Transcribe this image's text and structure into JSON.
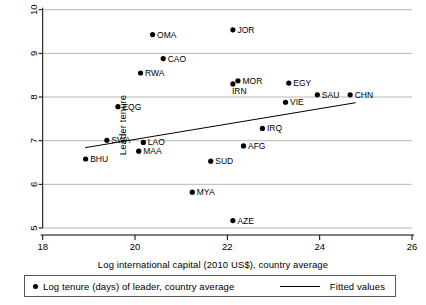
{
  "chart_data": {
    "type": "scatter",
    "title": "",
    "xlabel": "Log international capital (2010 US$), country average",
    "ylabel": "Leader tenure",
    "xlim": [
      18,
      26
    ],
    "ylim": [
      5,
      10
    ],
    "xticks": [
      18,
      20,
      22,
      24,
      26
    ],
    "yticks": [
      5,
      6,
      7,
      8,
      9,
      10
    ],
    "grid": "horizontal",
    "legend_position": "bottom",
    "series": [
      {
        "name": "Log tenure (days) of leader, country average",
        "marker": "filled-circle",
        "color": "#000000",
        "points": [
          {
            "label": "OMA",
            "x": 20.38,
            "y": 9.43
          },
          {
            "label": "CAO",
            "x": 20.61,
            "y": 8.88
          },
          {
            "label": "RWA",
            "x": 20.12,
            "y": 8.55
          },
          {
            "label": "EQG",
            "x": 19.63,
            "y": 7.78
          },
          {
            "label": "SWA",
            "x": 19.39,
            "y": 7.01
          },
          {
            "label": "BHU",
            "x": 18.93,
            "y": 6.58
          },
          {
            "label": "LAO",
            "x": 20.18,
            "y": 6.96
          },
          {
            "label": "MAA",
            "x": 20.08,
            "y": 6.76
          },
          {
            "label": "JOR",
            "x": 22.12,
            "y": 9.54
          },
          {
            "label": "MOR",
            "x": 22.23,
            "y": 8.37
          },
          {
            "label": "IRN",
            "x": 22.12,
            "y": 8.3
          },
          {
            "label": "EGY",
            "x": 23.33,
            "y": 8.32
          },
          {
            "label": "SAU",
            "x": 23.95,
            "y": 8.05
          },
          {
            "label": "CHN",
            "x": 24.66,
            "y": 8.05
          },
          {
            "label": "VIE",
            "x": 23.26,
            "y": 7.88
          },
          {
            "label": "IRQ",
            "x": 22.76,
            "y": 7.28
          },
          {
            "label": "AFG",
            "x": 22.35,
            "y": 6.88
          },
          {
            "label": "SUD",
            "x": 21.64,
            "y": 6.53
          },
          {
            "label": "MYA",
            "x": 21.24,
            "y": 5.82
          },
          {
            "label": "AZE",
            "x": 22.12,
            "y": 5.17
          }
        ]
      }
    ],
    "fit_line": {
      "name": "Fitted values",
      "color": "#000000",
      "x_start": 18.92,
      "y_start": 6.84,
      "x_end": 24.78,
      "y_end": 7.87
    }
  },
  "legend": {
    "marker_label": "Log tenure (days) of leader, country average",
    "line_label": "Fitted values"
  },
  "axes": {
    "x_title": "Log international capital (2010 US$), country average",
    "y_title": "Leader tenure"
  }
}
